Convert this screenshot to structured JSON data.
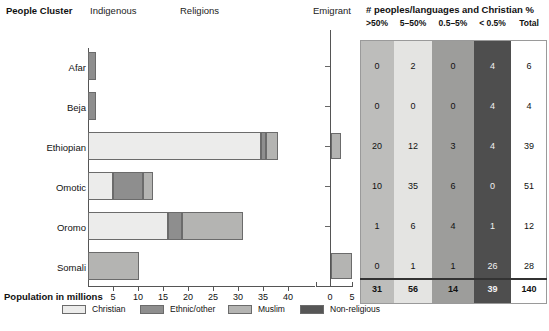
{
  "headers": {
    "people_cluster": "People Cluster",
    "indigenous": "Indigenous",
    "religions": "Religions",
    "emigrant": "Emigrant",
    "table_title": "# peoples/languages and Christian %"
  },
  "axis": {
    "title": "Population in millions",
    "main_ticks": [
      "5",
      "10",
      "15",
      "20",
      "25",
      "30",
      "35",
      "40"
    ],
    "emigrant_ticks": [
      "0",
      "5"
    ]
  },
  "legend": [
    {
      "label": "Christian",
      "color": "#ececeb",
      "key": "christian"
    },
    {
      "label": "Ethnic/other",
      "color": "#8e8e8e",
      "key": "ethnic"
    },
    {
      "label": "Muslim",
      "color": "#b4b4b2",
      "key": "muslim"
    },
    {
      "label": "Non-religious",
      "color": "#565656",
      "key": "nonrel"
    }
  ],
  "table": {
    "columns": [
      {
        "header": ">50%",
        "color": "#bdbdbb",
        "light_text": false
      },
      {
        "header": "5–50%",
        "color": "#e4e4e2",
        "light_text": false
      },
      {
        "header": "0.5–5%",
        "color": "#9d9d9b",
        "light_text": false
      },
      {
        "header": "< 0.5%",
        "color": "#4e4e4e",
        "light_text": true
      },
      {
        "header": "Total",
        "color": "#ffffff",
        "light_text": false
      }
    ],
    "rows": [
      {
        "cluster": "Afar",
        "values": [
          "0",
          "2",
          "0",
          "4",
          "6"
        ]
      },
      {
        "cluster": "Beja",
        "values": [
          "0",
          "0",
          "0",
          "4",
          "4"
        ]
      },
      {
        "cluster": "Ethiopian",
        "values": [
          "20",
          "12",
          "3",
          "4",
          "39"
        ]
      },
      {
        "cluster": "Omotic",
        "values": [
          "10",
          "35",
          "6",
          "0",
          "51"
        ]
      },
      {
        "cluster": "Oromo",
        "values": [
          "1",
          "6",
          "4",
          "1",
          "12"
        ]
      },
      {
        "cluster": "Somali",
        "values": [
          "0",
          "1",
          "1",
          "26",
          "28"
        ]
      }
    ],
    "total_row": {
      "label": "Total",
      "values": [
        "31",
        "56",
        "14",
        "39",
        "140"
      ]
    }
  },
  "chart_data": {
    "type": "bar",
    "orientation": "horizontal",
    "stacked": true,
    "title": "",
    "xlabel": "Population in millions",
    "ylabel": "",
    "xlim": [
      0,
      41
    ],
    "grid": false,
    "legend_position": "bottom",
    "categories": [
      "Afar",
      "Beja",
      "Ethiopian",
      "Omotic",
      "Oromo",
      "Somali"
    ],
    "series": [
      {
        "name": "Christian",
        "color": "#ececeb",
        "values": [
          0,
          0,
          34.5,
          5.0,
          16.0,
          0.0
        ]
      },
      {
        "name": "Ethnic/other",
        "color": "#8e8e8e",
        "values": [
          1.6,
          1.6,
          1.0,
          6.0,
          2.8,
          0.0
        ]
      },
      {
        "name": "Muslim",
        "color": "#b4b4b2",
        "values": [
          0,
          0,
          2.5,
          2.0,
          12.2,
          10.2
        ]
      },
      {
        "name": "Non-religious",
        "color": "#565656",
        "values": [
          0,
          0,
          0,
          0,
          0,
          0
        ]
      }
    ],
    "emigrant_panel": {
      "xlabel": "Emigrant",
      "xlim": [
        0,
        5
      ],
      "ticks": [
        0,
        5
      ],
      "values": [
        {
          "category": "Afar",
          "value": 0
        },
        {
          "category": "Beja",
          "value": 0
        },
        {
          "category": "Ethiopian",
          "value": 0.45
        },
        {
          "category": "Omotic",
          "value": 0
        },
        {
          "category": "Oromo",
          "value": 0
        },
        {
          "category": "Somali",
          "value": 0.95
        }
      ],
      "color": "#b4b4b2"
    },
    "table_panel": {
      "title": "# peoples/languages and Christian %",
      "columns": [
        ">50%",
        "5–50%",
        "0.5–5%",
        "< 0.5%",
        "Total"
      ],
      "rows": [
        {
          "cluster": "Afar",
          "values": [
            0,
            2,
            0,
            4,
            6
          ]
        },
        {
          "cluster": "Beja",
          "values": [
            0,
            0,
            0,
            4,
            4
          ]
        },
        {
          "cluster": "Ethiopian",
          "values": [
            20,
            12,
            3,
            4,
            39
          ]
        },
        {
          "cluster": "Omotic",
          "values": [
            10,
            35,
            6,
            0,
            51
          ]
        },
        {
          "cluster": "Oromo",
          "values": [
            1,
            6,
            4,
            1,
            12
          ]
        },
        {
          "cluster": "Somali",
          "values": [
            0,
            1,
            1,
            26,
            28
          ]
        }
      ],
      "totals": [
        31,
        56,
        14,
        39,
        140
      ]
    }
  }
}
